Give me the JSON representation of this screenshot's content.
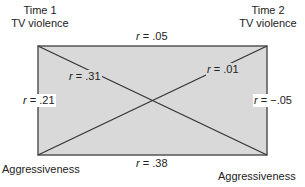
{
  "diagram": {
    "type": "cross-lagged panel correlation",
    "nodes": {
      "top_left": {
        "line1": "Time 1",
        "line2": "TV violence"
      },
      "top_right": {
        "line1": "Time 2",
        "line2": "TV violence"
      },
      "bottom_left": {
        "label": "Aggressiveness"
      },
      "bottom_right": {
        "label": "Aggressiveness"
      }
    },
    "correlations": {
      "top": {
        "symbol": "r",
        "value": "= .05"
      },
      "bottom": {
        "symbol": "r",
        "value": "= .38"
      },
      "left": {
        "symbol": "r",
        "value": "= .21"
      },
      "right": {
        "symbol": "r",
        "value": "= −.05"
      },
      "diag_tl_br": {
        "symbol": "r",
        "value": "= .31"
      },
      "diag_bl_tr": {
        "symbol": "r",
        "value": "= .01"
      }
    },
    "colors": {
      "box_fill": "#d9d9d9",
      "line": "#333333"
    }
  }
}
